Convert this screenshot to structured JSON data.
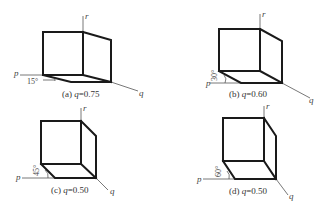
{
  "panels": [
    {
      "id": "a",
      "caption": "(a) q=0.75",
      "prefix": "(a) ",
      "var": "q",
      "value": "=0.75",
      "angle": "15°",
      "axes": {
        "p": "p",
        "q": "q",
        "r": "r"
      }
    },
    {
      "id": "b",
      "caption": "(b) q=0.60",
      "prefix": "(b) ",
      "var": "q",
      "value": "=0.60",
      "angle": "30°",
      "axes": {
        "p": "p",
        "q": "q",
        "r": "r"
      }
    },
    {
      "id": "c",
      "caption": "(c) q=0.50",
      "prefix": "(c) ",
      "var": "q",
      "value": "=0.50",
      "angle": "45°",
      "axes": {
        "p": "p",
        "q": "q",
        "r": "r"
      }
    },
    {
      "id": "d",
      "caption": "(d) q=0.50",
      "prefix": "(d) ",
      "var": "q",
      "value": "=0.50",
      "angle": "60°",
      "axes": {
        "p": "p",
        "q": "q",
        "r": "r"
      }
    }
  ],
  "colors": {
    "edge": "#1a1a1a",
    "axis": "#555555",
    "background": "#ffffff"
  }
}
